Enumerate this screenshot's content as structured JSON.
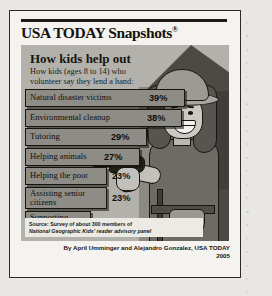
{
  "publication": {
    "logo": "USA TODAY Snapshots",
    "registered_mark": "®"
  },
  "snapshot": {
    "headline": "How kids help out",
    "subhead": "How kids (ages 8 to 14) who\nvolunteer say they lend a hand:",
    "source_line_1": "Source: Survey of about 300 members of",
    "source_line_2": "National Geographic Kids' reader advisory panel",
    "credit_line_1": "By April Umminger and Alejandro Gonzalez, USA TODAY",
    "credit_line_2": "2005"
  },
  "illustration": {
    "description": "girl-in-hard-hat-holding-power-drill",
    "elements": [
      "hard-hat",
      "power-drill",
      "tool-belt",
      "house-roof",
      "steps"
    ]
  },
  "colors": {
    "page": "#e8e7e3",
    "card": "#f4f3ef",
    "panel": "#b3b1ac",
    "bar_fill": "#8e8c87",
    "bar_stroke": "#16150f",
    "ink": "#141311"
  },
  "chart_data": {
    "type": "bar",
    "title": "How kids help out",
    "subtitle": "How kids (ages 8 to 14) who volunteer say they lend a hand:",
    "xlabel": "",
    "ylabel": "",
    "orientation": "horizontal",
    "unit": "%",
    "grid": false,
    "legend": "none",
    "xlim": [
      0,
      39
    ],
    "categories": [
      "Natural disaster victims",
      "Environmental cleanup",
      "Tutoring",
      "Helping animals",
      "Helping the poor",
      "Assisting senior citizens",
      "Supporting U.S. troops"
    ],
    "values": [
      39,
      38,
      29,
      27,
      23,
      23,
      18
    ],
    "value_labels": [
      "39%",
      "38%",
      "29%",
      "27%",
      "23%",
      "23%",
      "18%"
    ],
    "source": "Survey of about 300 members of National Geographic Kids' reader advisory panel"
  },
  "bars": [
    {
      "label": "Natural disaster victims",
      "value": "39%",
      "width": 160,
      "label_inside": true,
      "pct_inside": true,
      "pct_x": 124,
      "lines": 1
    },
    {
      "label": "Environmental cleanup",
      "value": "38%",
      "width": 157,
      "label_inside": true,
      "pct_inside": true,
      "pct_x": 122,
      "lines": 1
    },
    {
      "label": "Tutoring",
      "value": "29%",
      "width": 122,
      "label_inside": true,
      "pct_inside": true,
      "pct_x": 86,
      "lines": 1
    },
    {
      "label": "Helping animals",
      "value": "27%",
      "width": 115,
      "label_inside": true,
      "pct_inside": true,
      "pct_x": 79,
      "lines": 1
    },
    {
      "label": "Helping the poor",
      "value": "23%",
      "width": 82,
      "label_inside": true,
      "pct_inside": false,
      "pct_x": 87,
      "lines": 1
    },
    {
      "label": "Assisting senior\ncitizens",
      "value": "23%",
      "width": 82,
      "label_inside": true,
      "pct_inside": false,
      "pct_x": 87,
      "lines": 2
    },
    {
      "label": "Supporting\nU.S. troops",
      "value": "18%",
      "width": 66,
      "label_inside": true,
      "pct_inside": false,
      "pct_x": 71,
      "lines": 2
    }
  ],
  "page_bleed": {
    "lines": [
      "’",
      "t",
      "p",
      "y",
      "e",
      "e",
      "i",
      "a",
      "r",
      "o",
      "s",
      "n",
      "t",
      "e",
      "h",
      "d",
      "a",
      "l",
      "o",
      "v",
      "c",
      "i"
    ]
  }
}
